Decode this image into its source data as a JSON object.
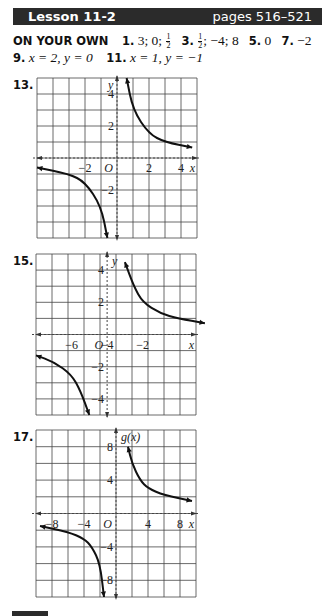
{
  "header": {
    "lesson": "Lesson 11-2",
    "pages": "pages 516–521",
    "bg_color": "#2b2b2b"
  },
  "answers": {
    "label": "ON YOUR OWN",
    "line1": [
      {
        "num": "1.",
        "text": "3; 0; ",
        "frac": [
          "1",
          "2"
        ],
        "after": ""
      },
      {
        "num": "3.",
        "text": "",
        "frac": [
          "1",
          "2"
        ],
        "after": "; −4; 8"
      },
      {
        "num": "5.",
        "text": "0"
      },
      {
        "num": "7.",
        "text": "−2"
      }
    ],
    "line2": [
      {
        "num": "9.",
        "text": "x = 2, y = 0"
      },
      {
        "num": "11.",
        "text": "x = 1, y = −1"
      }
    ]
  },
  "graphs": [
    {
      "number": "13.",
      "x_label": "x",
      "y_label": "y",
      "xlim": [
        -5,
        5
      ],
      "ylim": [
        -5,
        5
      ],
      "x_ticks": [
        "−2",
        "2",
        "4"
      ],
      "y_ticks": [
        "4",
        "2",
        "−2"
      ],
      "origin_label": "O"
    },
    {
      "number": "15.",
      "x_label": "x",
      "y_label": "y",
      "xlim": [
        -8,
        1
      ],
      "ylim": [
        -5,
        5
      ],
      "x_ticks": [
        "−6",
        "−4",
        "−2"
      ],
      "y_ticks": [
        "4",
        "2",
        "−2",
        "−4"
      ],
      "origin_label": "O"
    },
    {
      "number": "17.",
      "x_label": "x",
      "y_label": "g(x)",
      "xlim": [
        -10,
        10
      ],
      "ylim": [
        -10,
        10
      ],
      "x_ticks": [
        "−8",
        "−4",
        "4",
        "8"
      ],
      "y_ticks": [
        "8",
        "4",
        "−4",
        "−8"
      ],
      "origin_label": "O"
    }
  ],
  "chart_data": [
    {
      "type": "line",
      "title": "13.",
      "xlabel": "x",
      "ylabel": "y",
      "xlim": [
        -5,
        5
      ],
      "ylim": [
        -5,
        5
      ],
      "grid": true,
      "asymptotes": {
        "vertical": 0,
        "horizontal": 0
      },
      "series": [
        {
          "name": "right branch",
          "x": [
            0.6,
            1,
            2,
            3,
            4.7
          ],
          "y": [
            5,
            3,
            1.5,
            1,
            0.65
          ]
        },
        {
          "name": "left branch",
          "x": [
            -5,
            -3,
            -2,
            -1,
            -0.6
          ],
          "y": [
            -0.6,
            -1,
            -1.5,
            -3,
            -5
          ]
        }
      ]
    },
    {
      "type": "line",
      "title": "15.",
      "xlabel": "x",
      "ylabel": "y",
      "xlim": [
        -8,
        1
      ],
      "ylim": [
        -5,
        5
      ],
      "grid": true,
      "asymptotes": {
        "vertical": -4,
        "horizontal": 0
      },
      "series": [
        {
          "name": "right branch",
          "x": [
            -3,
            -2.5,
            -2,
            -1,
            0,
            1.5
          ],
          "y": [
            4.5,
            3,
            2,
            1.3,
            1,
            0.7
          ]
        },
        {
          "name": "left branch",
          "x": [
            -8,
            -7,
            -6,
            -5.5,
            -5
          ],
          "y": [
            -1.3,
            -1.7,
            -2.5,
            -3.5,
            -5
          ]
        }
      ]
    },
    {
      "type": "line",
      "title": "17.",
      "xlabel": "x",
      "ylabel": "g(x)",
      "xlim": [
        -10,
        10
      ],
      "ylim": [
        -10,
        10
      ],
      "grid": true,
      "asymptotes": {
        "vertical": 0,
        "horizontal": 0
      },
      "series": [
        {
          "name": "right branch",
          "x": [
            1.5,
            2,
            3,
            4,
            6,
            9.5
          ],
          "y": [
            8,
            6,
            4,
            3,
            2.2,
            1.5
          ]
        },
        {
          "name": "left branch",
          "x": [
            -9.5,
            -6,
            -4,
            -3,
            -2,
            -1.5
          ],
          "y": [
            -1.5,
            -2.2,
            -3,
            -4,
            -6,
            -10
          ]
        }
      ]
    }
  ]
}
